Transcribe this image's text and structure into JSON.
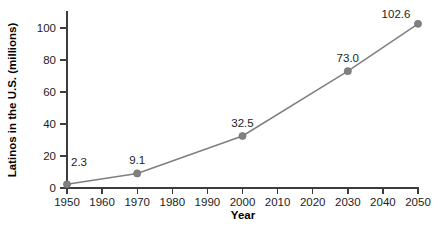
{
  "chart_data": {
    "type": "line",
    "title": "",
    "xlabel": "Year",
    "ylabel": "Latinos in the U.S. (millions)",
    "x": [
      1950,
      1970,
      2000,
      2030,
      2050
    ],
    "values": [
      2.3,
      9.1,
      32.5,
      73.0,
      102.6
    ],
    "point_labels": [
      "2.3",
      "9.1",
      "32.5",
      "73.0",
      "102.6"
    ],
    "xlim": [
      1950,
      2050
    ],
    "ylim": [
      0,
      108
    ],
    "xticks": [
      1950,
      1960,
      1970,
      1980,
      1990,
      2000,
      2010,
      2020,
      2030,
      2040,
      2050
    ],
    "xtick_labels": [
      "1950",
      "1960",
      "1970",
      "1980",
      "1990",
      "2000",
      "2010",
      "2020",
      "2030",
      "2040",
      "2050"
    ],
    "yticks": [
      0,
      20,
      40,
      60,
      80,
      100
    ],
    "ytick_labels": [
      "0",
      "20",
      "40",
      "60",
      "80",
      "100"
    ],
    "grid": false,
    "legend": "none",
    "marker": "circle",
    "colors": {
      "line": "#7f7f7f",
      "marker": "#808080",
      "axis": "#3c3c3c",
      "text": "#1c1c1c",
      "background": "#ffffff"
    }
  }
}
